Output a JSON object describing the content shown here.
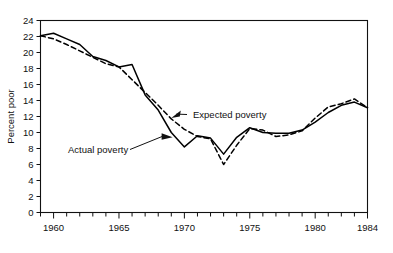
{
  "chart_data": {
    "type": "line",
    "title": "",
    "xlabel": "",
    "ylabel": "Percent poor",
    "xlim": [
      1959,
      1984
    ],
    "ylim": [
      0,
      24
    ],
    "ytick_step": 2,
    "yticks": [
      0,
      2,
      4,
      6,
      8,
      10,
      12,
      14,
      16,
      18,
      20,
      22,
      24
    ],
    "ytick_labels": [
      "0",
      "2",
      "4",
      "6",
      "8",
      "10",
      "12",
      "14",
      "16",
      "18",
      "20",
      "22",
      "24"
    ],
    "xticks_major": [
      1960,
      1965,
      1970,
      1975,
      1980,
      1984
    ],
    "xtick_labels": [
      "1960",
      "1965",
      "1970",
      "1975",
      "1980",
      "1984"
    ],
    "xticks_minor_step": 1,
    "grid": false,
    "legend_position": "inline-annotations",
    "x": [
      1959,
      1960,
      1961,
      1962,
      1963,
      1964,
      1965,
      1966,
      1967,
      1968,
      1969,
      1970,
      1971,
      1972,
      1973,
      1974,
      1975,
      1976,
      1977,
      1978,
      1979,
      1980,
      1981,
      1982,
      1983,
      1984
    ],
    "series": [
      {
        "name": "Actual poverty",
        "style": "solid",
        "color": "#000000",
        "values": [
          22.1,
          22.4,
          21.7,
          21.0,
          19.5,
          19.0,
          18.2,
          18.5,
          14.7,
          12.8,
          10.0,
          8.2,
          9.6,
          9.3,
          7.3,
          9.4,
          10.6,
          10.0,
          9.9,
          9.9,
          10.3,
          11.3,
          12.5,
          13.4,
          13.8,
          13.1
        ]
      },
      {
        "name": "Expected poverty",
        "style": "dashed",
        "color": "#000000",
        "values": [
          22.1,
          21.7,
          21.0,
          20.2,
          19.4,
          18.6,
          18.2,
          16.6,
          15.0,
          13.4,
          11.7,
          10.4,
          9.5,
          9.2,
          6.0,
          8.4,
          10.5,
          10.3,
          9.5,
          9.7,
          10.2,
          11.8,
          13.2,
          13.6,
          14.2,
          13.1
        ]
      }
    ],
    "annotations": [
      {
        "text": "Expected poverty",
        "target_x": 1969.0,
        "target_y": 11.8
      },
      {
        "text": "Actual poverty",
        "target_x": 1969.1,
        "target_y": 9.4
      }
    ]
  }
}
